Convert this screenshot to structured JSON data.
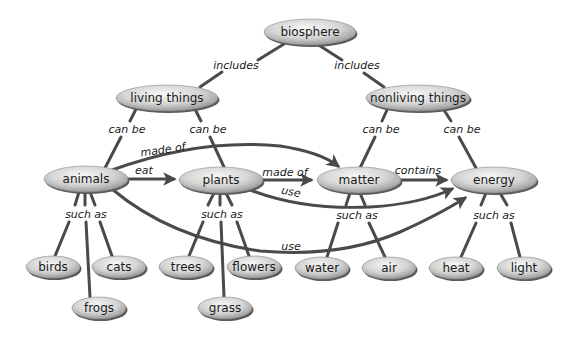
{
  "diagram": {
    "type": "concept-map",
    "colors": {
      "edge": "#4a4a4a",
      "node_fill_light": "#f4f4f4",
      "node_fill_dark": "#9a9a9a",
      "node_shadow": "#5a5a5a",
      "text": "#1a1a1a"
    },
    "nodes": {
      "biosphere": {
        "label": "biosphere",
        "x": 310,
        "y": 32,
        "rx": 46,
        "ry": 13
      },
      "living": {
        "label": "living things",
        "x": 167,
        "y": 98,
        "rx": 51,
        "ry": 13
      },
      "nonliving": {
        "label": "nonliving things",
        "x": 418,
        "y": 98,
        "rx": 52,
        "ry": 13
      },
      "animals": {
        "label": "animals",
        "x": 86,
        "y": 179,
        "rx": 42,
        "ry": 13
      },
      "plants": {
        "label": "plants",
        "x": 221,
        "y": 180,
        "rx": 42,
        "ry": 13
      },
      "matter": {
        "label": "matter",
        "x": 359,
        "y": 180,
        "rx": 42,
        "ry": 13
      },
      "energy": {
        "label": "energy",
        "x": 494,
        "y": 180,
        "rx": 43,
        "ry": 13
      },
      "birds": {
        "label": "birds",
        "x": 53,
        "y": 267,
        "rx": 27,
        "ry": 11
      },
      "cats": {
        "label": "cats",
        "x": 119,
        "y": 267,
        "rx": 27,
        "ry": 11
      },
      "frogs": {
        "label": "frogs",
        "x": 99,
        "y": 308,
        "rx": 27,
        "ry": 11
      },
      "trees": {
        "label": "trees",
        "x": 186,
        "y": 267,
        "rx": 27,
        "ry": 11
      },
      "flowers": {
        "label": "flowers",
        "x": 254,
        "y": 267,
        "rx": 27,
        "ry": 11
      },
      "grass": {
        "label": "grass",
        "x": 225,
        "y": 308,
        "rx": 27,
        "ry": 11
      },
      "water": {
        "label": "water",
        "x": 322,
        "y": 268,
        "rx": 27,
        "ry": 11
      },
      "air": {
        "label": "air",
        "x": 389,
        "y": 268,
        "rx": 27,
        "ry": 11
      },
      "heat": {
        "label": "heat",
        "x": 456,
        "y": 268,
        "rx": 27,
        "ry": 11
      },
      "light": {
        "label": "light",
        "x": 524,
        "y": 268,
        "rx": 27,
        "ry": 11
      }
    },
    "link_labels": {
      "includes_left": {
        "text": "includes",
        "x": 236,
        "y": 65
      },
      "includes_right": {
        "text": "includes",
        "x": 357,
        "y": 65
      },
      "living_canbe_l": {
        "text": "can be",
        "x": 127,
        "y": 129
      },
      "living_canbe_r": {
        "text": "can be",
        "x": 208,
        "y": 129
      },
      "nonliv_canbe_l": {
        "text": "can be",
        "x": 381,
        "y": 129
      },
      "nonliv_canbe_r": {
        "text": "can be",
        "x": 462,
        "y": 129
      },
      "animals_madeof": {
        "text": "made of",
        "x": 163,
        "y": 150
      },
      "animals_eat": {
        "text": "eat",
        "x": 144,
        "y": 170
      },
      "plants_madeof": {
        "text": "made of",
        "x": 285,
        "y": 172
      },
      "plants_use": {
        "text": "use",
        "x": 291,
        "y": 192
      },
      "matter_contains": {
        "text": "contains",
        "x": 418,
        "y": 170
      },
      "animals_suchas": {
        "text": "such as",
        "x": 86,
        "y": 214
      },
      "plants_suchas": {
        "text": "such as",
        "x": 222,
        "y": 214
      },
      "matter_suchas": {
        "text": "such as",
        "x": 357,
        "y": 215
      },
      "energy_suchas": {
        "text": "such as",
        "x": 494,
        "y": 215
      },
      "animals_use": {
        "text": "use",
        "x": 291,
        "y": 246
      }
    }
  }
}
